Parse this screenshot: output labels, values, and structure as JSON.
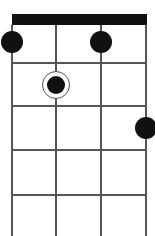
{
  "diagram": {
    "type": "chord-diagram",
    "instrument_strings": 4,
    "visible_frets": 5,
    "nut_visible": true,
    "strings_x": [
      12,
      56,
      101,
      146
    ],
    "frets_y": [
      63,
      106,
      150,
      195
    ],
    "nut": {
      "top": 14,
      "height": 11
    },
    "colors": {
      "nut": "#111111",
      "lines": "#555555",
      "dot": "#111111",
      "background": "#ffffff"
    },
    "finger_positions": [
      {
        "string": 1,
        "fret": 1,
        "cx": 12,
        "cy": 42,
        "ring": false
      },
      {
        "string": 2,
        "fret": 2,
        "cx": 56,
        "cy": 85,
        "ring": true
      },
      {
        "string": 3,
        "fret": 1,
        "cx": 101,
        "cy": 42,
        "ring": false
      },
      {
        "string": 4,
        "fret": 3,
        "cx": 146,
        "cy": 128,
        "ring": false
      }
    ]
  }
}
